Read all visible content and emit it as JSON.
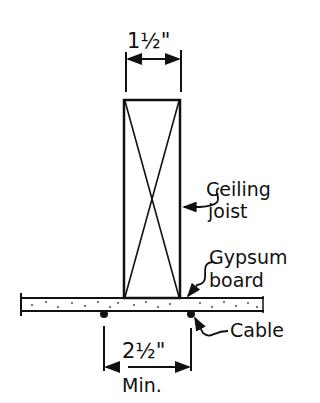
{
  "diagram": {
    "type": "construction-detail",
    "dimensions": {
      "joist_width": "1½\"",
      "cable_spacing": "2½\"",
      "cable_spacing_qualifier": "Min."
    },
    "callouts": {
      "joist_line1": "Ceiling",
      "joist_line2": "joist",
      "board_line1": "Gypsum",
      "board_line2": "board",
      "cable": "Cable"
    },
    "colors": {
      "ink": "#111111",
      "background": "#ffffff"
    }
  }
}
